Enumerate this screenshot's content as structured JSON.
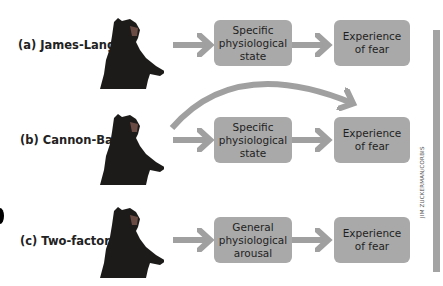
{
  "figure": {
    "rows": [
      {
        "id": "a",
        "label": "(a) James-Lange",
        "middle": [
          "Specific",
          "physiological",
          "state"
        ],
        "end": [
          "Experience",
          "of fear"
        ],
        "has_direct_arrow": false
      },
      {
        "id": "b",
        "label": "(b) Cannon-Bard",
        "middle": [
          "Specific",
          "physiological",
          "state"
        ],
        "end": [
          "Experience",
          "of fear"
        ],
        "has_direct_arrow": true
      },
      {
        "id": "c",
        "label": "(c) Two-factor",
        "middle": [
          "General",
          "physiological",
          "arousal"
        ],
        "end": [
          "Experience",
          "of fear"
        ],
        "has_direct_arrow": false
      }
    ],
    "photo_credit": "JIM ZUCKERMAN/CORBIS",
    "colors": {
      "box": "#a9a9a9",
      "arrow": "#a0a0a0",
      "text": "#1f1f1f",
      "sidebar": "#a3a3a3"
    }
  }
}
